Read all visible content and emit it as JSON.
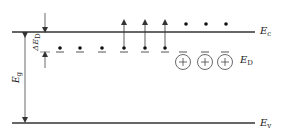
{
  "diagram": {
    "type": "energy-band-diagram",
    "colors": {
      "line": "#333333",
      "text": "#222222",
      "background": "#ffffff"
    },
    "levels": {
      "conduction": {
        "symbol": "E",
        "sub": "c"
      },
      "donor": {
        "symbol": "E",
        "sub": "D"
      },
      "valence": {
        "symbol": "E",
        "sub": "v"
      }
    },
    "dimensions": {
      "bandgap": {
        "symbol": "E",
        "sub": "g"
      },
      "donor_ionization": {
        "symbol": "ΔE",
        "sub": "D"
      }
    },
    "donor_sites": 8,
    "electrons_on_donor_level": 6,
    "electrons_excited_arrows": 3,
    "electrons_in_conduction_band": 3,
    "ionized_donors": {
      "count": 3,
      "symbol": "+"
    }
  }
}
